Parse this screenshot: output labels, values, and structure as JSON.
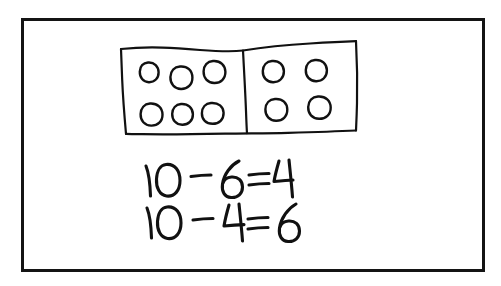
{
  "canvas": {
    "width": 501,
    "height": 286,
    "background_color": "#ffffff"
  },
  "frame": {
    "name": "board-border",
    "color": "#141414",
    "thickness": 3
  },
  "ink": {
    "color": "#111111",
    "style": "hand-drawn marker"
  },
  "diagram": {
    "total_count": 10,
    "cells": [
      {
        "name": "left-part",
        "count": 6,
        "rows": [
          {
            "circles": 3
          },
          {
            "circles": 3
          }
        ]
      },
      {
        "name": "right-part",
        "count": 4,
        "rows": [
          {
            "circles": 2
          },
          {
            "circles": 2
          }
        ]
      }
    ]
  },
  "equations": [
    {
      "name": "equation-line-1",
      "text": "10 - 6 = 4",
      "minuend": 10,
      "subtrahend": 6,
      "difference": 4
    },
    {
      "name": "equation-line-2",
      "text": "10 - 4 = 6",
      "minuend": 10,
      "subtrahend": 4,
      "difference": 6
    }
  ]
}
